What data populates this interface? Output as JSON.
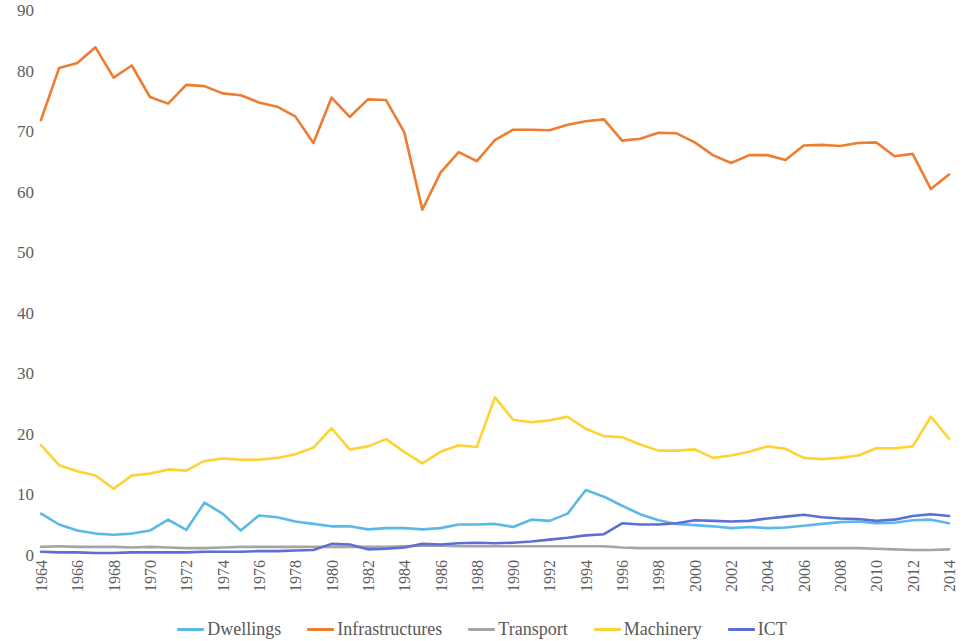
{
  "chart_data": {
    "type": "line",
    "title": "",
    "subtitle": "",
    "xlabel": "",
    "ylabel": "",
    "xlim": [
      1964,
      2014
    ],
    "ylim": [
      0,
      90
    ],
    "grid": false,
    "legend_position": "bottom",
    "x": [
      1964,
      1965,
      1966,
      1967,
      1968,
      1969,
      1970,
      1971,
      1972,
      1973,
      1974,
      1975,
      1976,
      1977,
      1978,
      1979,
      1980,
      1981,
      1982,
      1983,
      1984,
      1985,
      1986,
      1987,
      1988,
      1989,
      1990,
      1991,
      1992,
      1993,
      1994,
      1995,
      1996,
      1997,
      1998,
      1999,
      2000,
      2001,
      2002,
      2003,
      2004,
      2005,
      2006,
      2007,
      2008,
      2009,
      2010,
      2011,
      2012,
      2013,
      2014
    ],
    "x_tick_labels": [
      "1964",
      "1966",
      "1968",
      "1970",
      "1972",
      "1974",
      "1976",
      "1978",
      "1980",
      "1982",
      "1984",
      "1986",
      "1988",
      "1990",
      "1992",
      "1994",
      "1996",
      "1998",
      "2000",
      "2002",
      "2004",
      "2006",
      "2008",
      "2010",
      "2012",
      "2014"
    ],
    "y_tick_labels": [
      "90",
      "80",
      "70",
      "60",
      "50",
      "40",
      "30",
      "20",
      "10",
      "0"
    ],
    "y_ticks": [
      90,
      80,
      70,
      60,
      50,
      40,
      30,
      20,
      10,
      0
    ],
    "series": [
      {
        "name": "Dwellings",
        "color": "#5BB9E8",
        "values": [
          7.0,
          5.2,
          4.2,
          3.7,
          3.5,
          3.7,
          4.2,
          6.0,
          4.3,
          8.8,
          7.0,
          4.2,
          6.7,
          6.4,
          5.7,
          5.3,
          4.9,
          4.9,
          4.4,
          4.6,
          4.6,
          4.4,
          4.6,
          5.2,
          5.2,
          5.3,
          4.8,
          6.0,
          5.8,
          7.0,
          10.9,
          9.8,
          8.3,
          6.9,
          5.9,
          5.3,
          5.1,
          4.9,
          4.6,
          4.8,
          4.6,
          4.7,
          5.0,
          5.3,
          5.6,
          5.7,
          5.4,
          5.5,
          5.9,
          6.0,
          5.4
        ]
      },
      {
        "name": "Infrastructures",
        "color": "#ED7D31",
        "values": [
          72.0,
          80.6,
          81.4,
          84.0,
          79.0,
          81.0,
          75.8,
          74.7,
          77.8,
          77.6,
          76.4,
          76.1,
          74.9,
          74.2,
          72.6,
          68.2,
          75.7,
          72.5,
          75.4,
          75.3,
          70.0,
          57.2,
          63.3,
          66.7,
          65.2,
          68.7,
          70.4,
          70.4,
          70.3,
          71.2,
          71.8,
          72.1,
          68.6,
          68.9,
          69.9,
          69.8,
          68.3,
          66.2,
          64.9,
          66.2,
          66.2,
          65.4,
          67.8,
          67.9,
          67.7,
          68.2,
          68.3,
          66.0,
          66.4,
          60.6,
          63.0
        ]
      },
      {
        "name": "Transport",
        "color": "#A5A5A5",
        "values": [
          1.5,
          1.6,
          1.5,
          1.5,
          1.5,
          1.4,
          1.5,
          1.4,
          1.3,
          1.3,
          1.4,
          1.5,
          1.5,
          1.5,
          1.5,
          1.5,
          1.5,
          1.5,
          1.5,
          1.5,
          1.6,
          1.7,
          1.7,
          1.6,
          1.6,
          1.6,
          1.6,
          1.6,
          1.6,
          1.6,
          1.6,
          1.6,
          1.4,
          1.3,
          1.3,
          1.3,
          1.3,
          1.3,
          1.3,
          1.3,
          1.3,
          1.3,
          1.3,
          1.3,
          1.3,
          1.3,
          1.2,
          1.1,
          1.0,
          1.0,
          1.1
        ]
      },
      {
        "name": "Machinery",
        "color": "#FFD234",
        "values": [
          18.3,
          15.0,
          14.0,
          13.3,
          11.1,
          13.3,
          13.6,
          14.3,
          14.1,
          15.7,
          16.1,
          15.9,
          15.9,
          16.2,
          16.8,
          17.9,
          21.1,
          17.6,
          18.1,
          19.3,
          17.2,
          15.3,
          17.2,
          18.3,
          18.0,
          26.2,
          22.5,
          22.1,
          22.4,
          23.0,
          21.0,
          19.8,
          19.6,
          18.4,
          17.4,
          17.4,
          17.6,
          16.2,
          16.6,
          17.2,
          18.1,
          17.7,
          16.2,
          16.0,
          16.2,
          16.6,
          17.8,
          17.8,
          18.1,
          23.0,
          19.4
        ]
      },
      {
        "name": "ICT",
        "color": "#5B6FD6",
        "values": [
          0.7,
          0.6,
          0.6,
          0.5,
          0.5,
          0.6,
          0.6,
          0.6,
          0.6,
          0.7,
          0.7,
          0.7,
          0.8,
          0.8,
          0.9,
          1.0,
          2.0,
          1.9,
          1.1,
          1.2,
          1.4,
          2.0,
          1.9,
          2.1,
          2.2,
          2.1,
          2.2,
          2.4,
          2.7,
          3.0,
          3.4,
          3.6,
          5.4,
          5.2,
          5.2,
          5.4,
          5.9,
          5.8,
          5.7,
          5.8,
          6.2,
          6.5,
          6.8,
          6.4,
          6.2,
          6.1,
          5.8,
          6.0,
          6.6,
          6.9,
          6.6
        ]
      }
    ]
  },
  "legend": {
    "items": [
      {
        "label": "Dwellings",
        "color": "#5BB9E8"
      },
      {
        "label": "Infrastructures",
        "color": "#ED7D31"
      },
      {
        "label": "Transport",
        "color": "#A5A5A5"
      },
      {
        "label": "Machinery",
        "color": "#FFD234"
      },
      {
        "label": "ICT",
        "color": "#5B6FD6"
      }
    ]
  }
}
